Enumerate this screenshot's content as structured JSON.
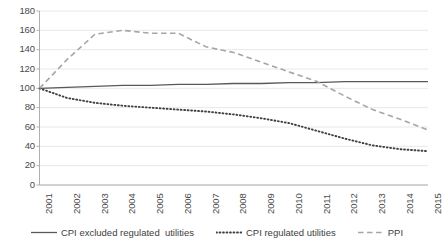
{
  "chart_data": {
    "type": "line",
    "title": "",
    "xlabel": "",
    "ylabel": "",
    "x": [
      2001,
      2002,
      2003,
      2004,
      2005,
      2006,
      2007,
      2008,
      2009,
      2010,
      2011,
      2012,
      2013,
      2014,
      2015
    ],
    "categories": [
      "2001",
      "2002",
      "2003",
      "2004",
      "2005",
      "2006",
      "2007",
      "2008",
      "2009",
      "2010",
      "2011",
      "2012",
      "2013",
      "2014",
      "2015"
    ],
    "ylim": [
      0,
      180
    ],
    "ytick_step": 20,
    "yticks": [
      "180",
      "160",
      "140",
      "120",
      "100",
      "80",
      "60",
      "40",
      "20",
      "0"
    ],
    "grid": true,
    "legend_position": "bottom",
    "series": [
      {
        "name": "CPI excluded regulated  utilities",
        "style": "solid",
        "color": "#595959",
        "values": [
          100,
          101,
          102,
          103,
          103,
          104,
          104,
          105,
          105,
          106,
          106,
          107,
          107,
          107,
          107
        ]
      },
      {
        "name": "CPI regulated utilities",
        "style": "dotted",
        "color": "#3f3f3f",
        "values": [
          100,
          90,
          85,
          82,
          80,
          78,
          76,
          73,
          69,
          64,
          56,
          48,
          41,
          37,
          35
        ]
      },
      {
        "name": "PPI",
        "style": "dashed",
        "color": "#a6a6a6",
        "values": [
          100,
          130,
          156,
          160,
          157,
          157,
          143,
          137,
          127,
          117,
          107,
          92,
          78,
          68,
          57
        ]
      }
    ]
  },
  "axis": {
    "yticks": [
      "180",
      "160",
      "140",
      "120",
      "100",
      "80",
      "60",
      "40",
      "20",
      "0"
    ],
    "xticks": [
      "2001",
      "2002",
      "2003",
      "2004",
      "2005",
      "2006",
      "2007",
      "2008",
      "2009",
      "2010",
      "2011",
      "2012",
      "2013",
      "2014",
      "2015"
    ]
  },
  "legend": {
    "items": [
      {
        "label": "CPI excluded regulated  utilities",
        "style": "solid",
        "color": "#595959"
      },
      {
        "label": "CPI regulated utilities",
        "style": "dotted",
        "color": "#3f3f3f"
      },
      {
        "label": "PPI",
        "style": "dashed",
        "color": "#a6a6a6"
      }
    ]
  },
  "colors": {
    "grid": "#e8e8e8",
    "axis": "#b0b0b0",
    "text": "#4a4a4a",
    "solid_series": "#595959",
    "dotted_series": "#3f3f3f",
    "dashed_series": "#a6a6a6"
  }
}
